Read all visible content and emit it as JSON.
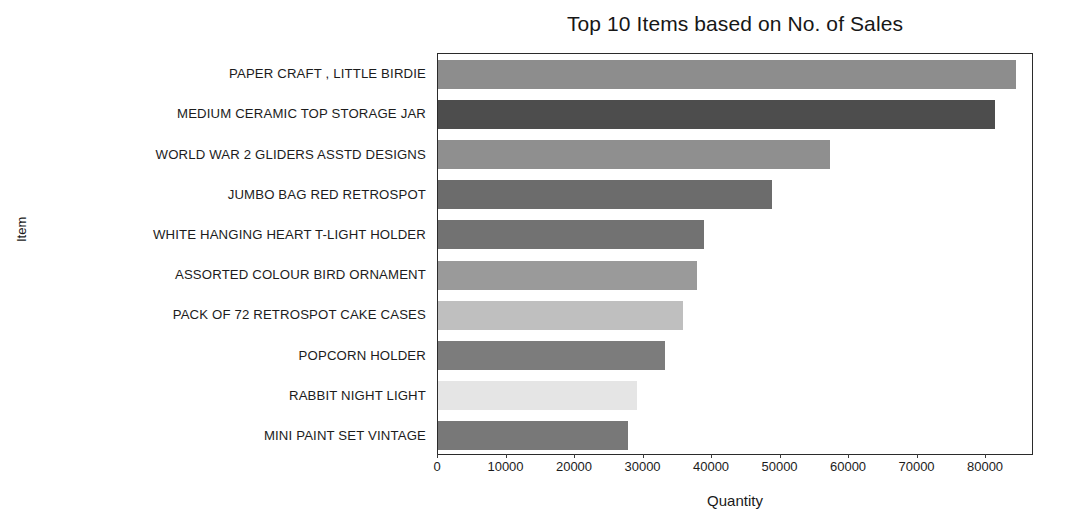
{
  "chart_data": {
    "type": "bar",
    "orientation": "horizontal",
    "title": "Top 10 Items based on No. of Sales",
    "xlabel": "Quantity",
    "ylabel": "Item",
    "grid": false,
    "legend": null,
    "xlim": [
      0,
      87000
    ],
    "xticks": [
      0,
      10000,
      20000,
      30000,
      40000,
      50000,
      60000,
      70000,
      80000
    ],
    "xtick_labels": [
      "0",
      "10000",
      "20000",
      "30000",
      "40000",
      "50000",
      "60000",
      "70000",
      "80000"
    ],
    "categories": [
      "PAPER CRAFT , LITTLE BIRDIE",
      "MEDIUM CERAMIC TOP STORAGE JAR",
      "WORLD WAR 2 GLIDERS ASSTD DESIGNS",
      "JUMBO BAG RED RETROSPOT",
      "WHITE HANGING HEART T-LIGHT HOLDER",
      "ASSORTED COLOUR BIRD ORNAMENT",
      "PACK OF 72 RETROSPOT CAKE CASES",
      "POPCORN HOLDER",
      "RABBIT NIGHT LIGHT",
      "MINI PAINT SET VINTAGE"
    ],
    "values": [
      84300,
      81300,
      57200,
      48700,
      38800,
      37800,
      35700,
      33100,
      29000,
      27800
    ],
    "bar_colors": [
      "#8d8d8d",
      "#4d4d4d",
      "#8f8f8f",
      "#6c6c6c",
      "#727272",
      "#9a9a9a",
      "#bfbfbf",
      "#7c7c7c",
      "#e5e5e5",
      "#787878"
    ]
  },
  "axes": {
    "frame_color": "#2b2b2b"
  }
}
